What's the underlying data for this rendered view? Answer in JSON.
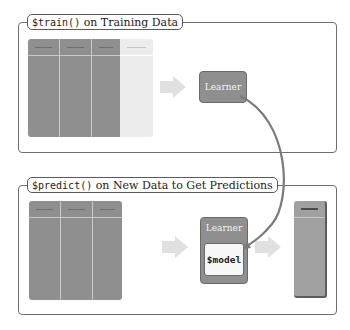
{
  "train_panel": {
    "title_code": "$train()",
    "title_text": " on Training Data",
    "learner_label": "Learner",
    "table": {
      "feature_columns": 3,
      "target_columns": 1,
      "feature_color": "#8f8f8f",
      "target_color": "#ececec"
    }
  },
  "predict_panel": {
    "title_code": "$predict()",
    "title_text": " on New Data to Get Predictions",
    "learner_label": "Learner",
    "model_label": "$model",
    "table": {
      "feature_columns": 3,
      "feature_color": "#8f8f8f"
    },
    "prediction_column_color": "#a0a0a0"
  },
  "colors": {
    "border": "#6f6f6f",
    "arrow": "#e0e0e0",
    "learner": "#8f8f8f",
    "curve": "#7a7a7a"
  }
}
